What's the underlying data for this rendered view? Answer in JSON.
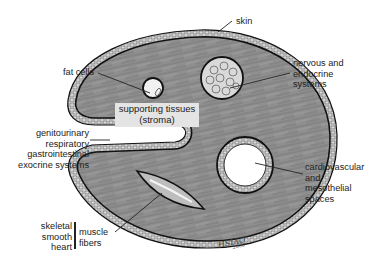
{
  "diagram": {
    "labels": {
      "skin": "skin",
      "fat_cells": "fat cells",
      "supporting_tissues": [
        "supporting tissues",
        "(stroma)"
      ],
      "nervous": [
        "nervous and",
        "endocrine",
        "systems"
      ],
      "epithelial_systems": [
        "genitourinary",
        "respiratory",
        "gastrointestinal",
        "exocrine systems"
      ],
      "cardiovascular": [
        "cardiovascular",
        "and",
        "mesothelial",
        "spaces"
      ],
      "muscle_types": [
        "skeletal",
        "smooth",
        "heart"
      ],
      "muscle_fibers": [
        "muscle",
        "fibers"
      ],
      "signature": "HSIAO",
      "signature_year": "2000"
    },
    "colors": {
      "body_fill": "#8a8a8a",
      "outline": "#111111",
      "background": "#ffffff",
      "stroma_box": "#e4e4e4"
    }
  }
}
